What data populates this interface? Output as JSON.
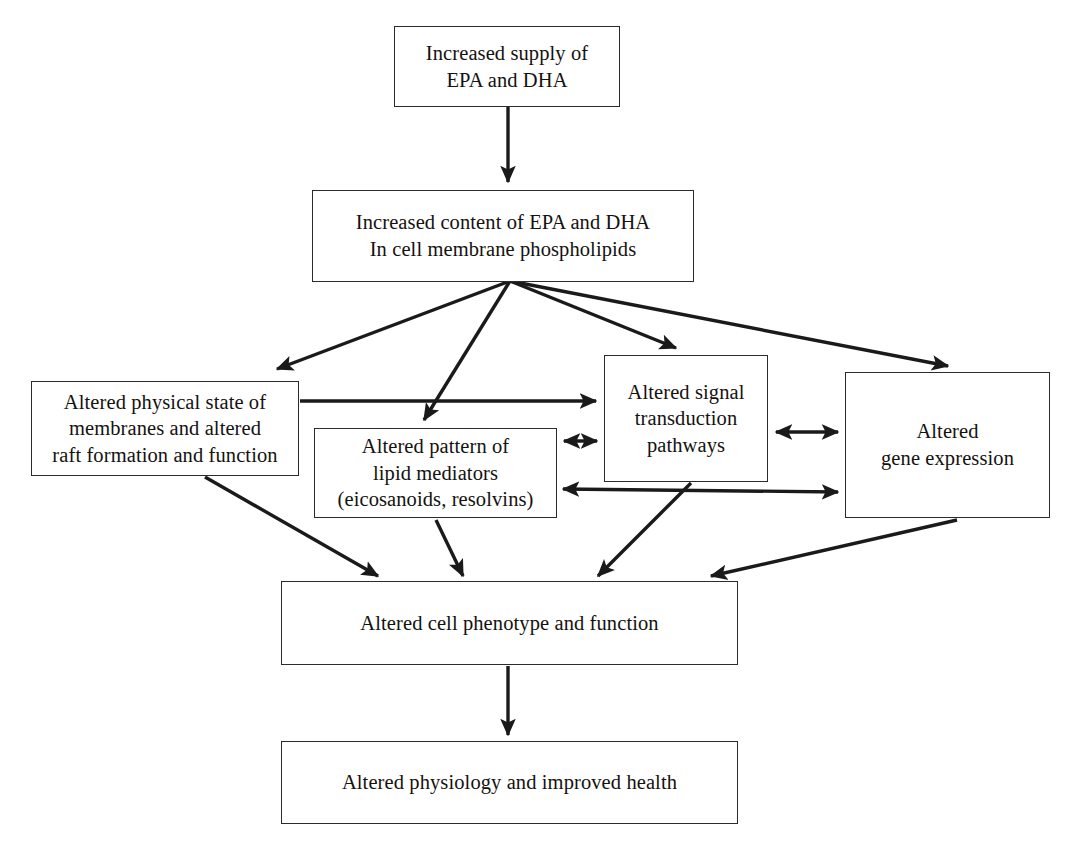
{
  "diagram": {
    "type": "flowchart",
    "background_color": "#ffffff",
    "line_color": "#1a1a1a",
    "text_color": "#14120f",
    "nodes": [
      {
        "id": "supply",
        "text": "Increased supply of\nEPA and DHA",
        "x": 394,
        "y": 26,
        "w": 226,
        "h": 81
      },
      {
        "id": "content",
        "text": "Increased content of EPA and DHA\nIn cell membrane phospholipids",
        "x": 312,
        "y": 190,
        "w": 382,
        "h": 92
      },
      {
        "id": "physical_state",
        "text": "Altered physical state of\nmembranes and altered\nraft formation and function",
        "x": 31,
        "y": 381,
        "w": 268,
        "h": 95
      },
      {
        "id": "lipid_mediators",
        "text": "Altered pattern of\nlipid mediators\n(eicosanoids, resolvins)",
        "x": 314,
        "y": 428,
        "w": 243,
        "h": 90
      },
      {
        "id": "signal_transduction",
        "text": "Altered signal\ntransduction\npathways",
        "x": 604,
        "y": 355,
        "w": 164,
        "h": 127
      },
      {
        "id": "gene_expression",
        "text": "Altered\ngene expression",
        "x": 845,
        "y": 372,
        "w": 205,
        "h": 146
      },
      {
        "id": "cell_phenotype",
        "text": "Altered cell phenotype and function",
        "x": 281,
        "y": 581,
        "w": 457,
        "h": 84
      },
      {
        "id": "physiology",
        "text": "Altered physiology and improved health",
        "x": 281,
        "y": 741,
        "w": 457,
        "h": 83
      }
    ],
    "edges": [
      {
        "id": "supply-to-content",
        "from": "supply",
        "to": "content",
        "style": "single",
        "path": "M 508,107 L 508,182"
      },
      {
        "id": "content-to-physical-state",
        "from": "content",
        "to": "physical_state",
        "style": "single",
        "path": "M 510,281 L 277,369"
      },
      {
        "id": "content-to-lipid-mediators",
        "from": "content",
        "to": "lipid_mediators",
        "style": "single",
        "path": "M 510,281 L 424,420"
      },
      {
        "id": "content-to-signal-transduction",
        "from": "content",
        "to": "signal_transduction",
        "style": "single",
        "path": "M 510,281 L 676,348"
      },
      {
        "id": "content-to-gene-expression",
        "from": "content",
        "to": "gene_expression",
        "style": "single",
        "path": "M 510,281 L 948,366"
      },
      {
        "id": "physical-state-to-signal-transduction",
        "from": "physical_state",
        "to": "signal_transduction",
        "style": "single",
        "path": "M 300,401 L 596,401"
      },
      {
        "id": "lipid-mediators-signal-transduction",
        "from": "lipid_mediators",
        "to": "signal_transduction",
        "style": "double",
        "path": "M 564,441 L 597,441"
      },
      {
        "id": "signal-transduction-gene-expression",
        "from": "signal_transduction",
        "to": "gene_expression",
        "style": "double",
        "path": "M 776,432 L 838,432"
      },
      {
        "id": "lipid-mediators-gene-expression",
        "from": "lipid_mediators",
        "to": "gene_expression",
        "style": "double",
        "path": "M 563,489 L 838,492"
      },
      {
        "id": "physical-state-to-cell-phenotype",
        "from": "physical_state",
        "to": "cell_phenotype",
        "style": "single",
        "path": "M 205,477 L 378,576"
      },
      {
        "id": "lipid-mediators-to-cell-phenotype",
        "from": "lipid_mediators",
        "to": "cell_phenotype",
        "style": "single",
        "path": "M 436,520 L 463,576"
      },
      {
        "id": "signal-transduction-to-cell-phenotype",
        "from": "signal_transduction",
        "to": "cell_phenotype",
        "style": "single",
        "path": "M 691,483 L 598,576"
      },
      {
        "id": "gene-expression-to-cell-phenotype",
        "from": "gene_expression",
        "to": "cell_phenotype",
        "style": "single",
        "path": "M 957,520 L 711,576"
      },
      {
        "id": "cell-phenotype-to-physiology",
        "from": "cell_phenotype",
        "to": "physiology",
        "style": "single",
        "path": "M 508,666 L 508,735"
      }
    ]
  }
}
